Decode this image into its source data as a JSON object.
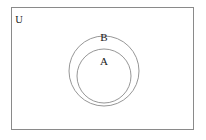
{
  "diagram": {
    "type": "euler-diagram",
    "background_color": "#ffffff",
    "stroke_color": "#808080",
    "text_color": "#1a1a1a",
    "universe": {
      "label": "U",
      "shape": "rectangle",
      "x": 11,
      "y": 7,
      "width": 183,
      "height": 123,
      "label_x": 19,
      "label_y": 23
    },
    "sets": [
      {
        "label": "B",
        "shape": "circle",
        "cx": 104,
        "cy": 71,
        "r": 35,
        "label_x": 104,
        "label_y": 41
      },
      {
        "label": "A",
        "shape": "circle",
        "cx": 104,
        "cy": 76,
        "r": 27,
        "label_x": 104,
        "label_y": 65
      }
    ]
  }
}
